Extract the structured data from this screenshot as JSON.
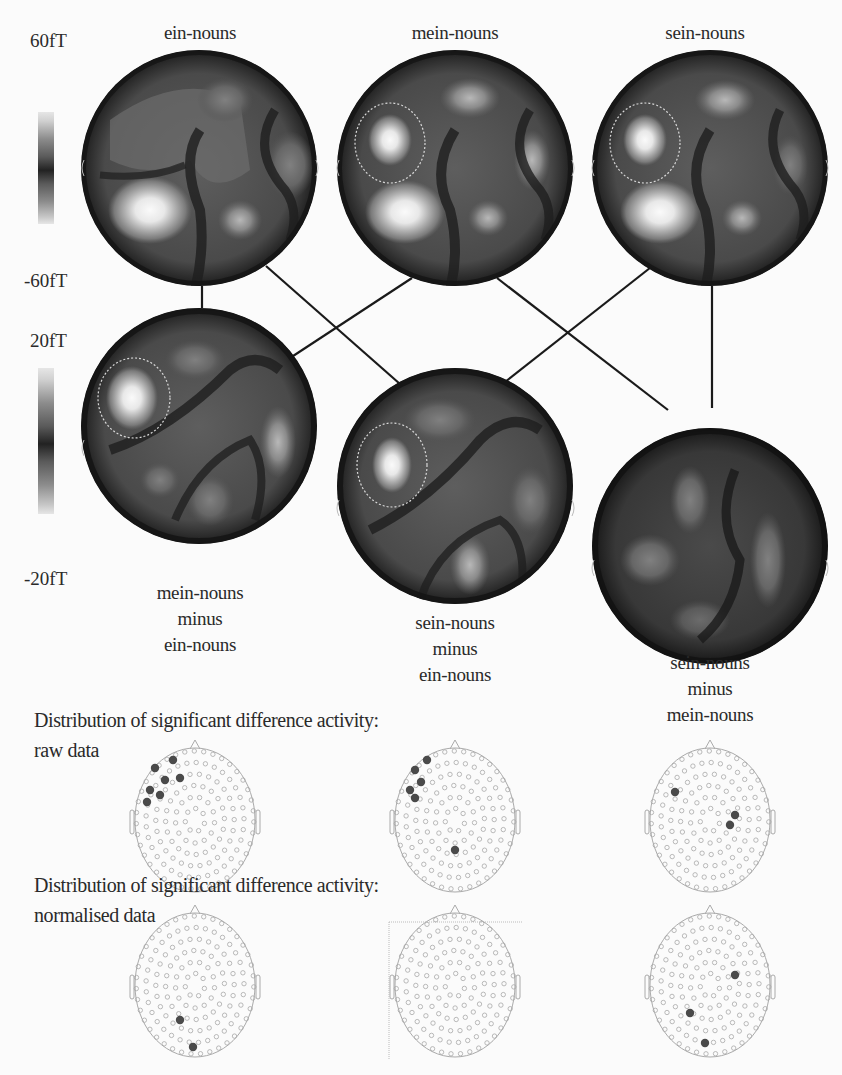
{
  "figure": {
    "top_row": {
      "scale": {
        "max": "60fT",
        "min": "-60fT"
      },
      "maps": [
        {
          "label": "ein-nouns"
        },
        {
          "label": "mein-nouns"
        },
        {
          "label": "sein-nouns"
        }
      ]
    },
    "difference_row": {
      "scale": {
        "max": "20fT",
        "min": "-20fT"
      },
      "maps": [
        {
          "label_lines": [
            "mein-nouns",
            "minus",
            "ein-nouns"
          ]
        },
        {
          "label_lines": [
            "sein-nouns",
            "minus",
            "ein-nouns"
          ]
        },
        {
          "label_lines": [
            "sein-nouns",
            "minus",
            "mein-nouns"
          ]
        }
      ]
    },
    "raw_section": {
      "title_line1": "Distribution of significant difference activity:",
      "title_line2": "raw data"
    },
    "normalised_section": {
      "title_line1": "Distribution of significant difference activity:",
      "title_line2": "normalised data"
    },
    "colors": {
      "background": "#fbfbfb",
      "map_dark": "#1e1e1e",
      "map_mid": "#5a5a5a",
      "map_bright": "#f4f4f4",
      "sensor_outline": "#9a9a9a",
      "sensor_significant": "#4a4a4a"
    }
  }
}
